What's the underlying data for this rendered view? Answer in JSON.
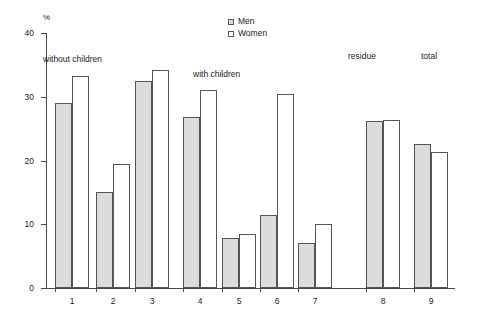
{
  "chart_data": {
    "type": "bar",
    "title": "",
    "xlabel": "",
    "ylabel": "%",
    "ylim": [
      0,
      40
    ],
    "yticks": [
      0,
      10,
      20,
      30,
      40
    ],
    "grid": false,
    "legend_position": "top-center",
    "categories": [
      "1",
      "2",
      "3",
      "4",
      "5",
      "6",
      "7",
      "8",
      "9"
    ],
    "series": [
      {
        "name": "Men",
        "color": "#dcdcdc",
        "values": [
          29.0,
          15.0,
          32.5,
          26.8,
          7.8,
          11.5,
          7.0,
          26.2,
          22.6
        ]
      },
      {
        "name": "Women",
        "color": "#ffffff",
        "values": [
          33.3,
          19.4,
          34.2,
          31.0,
          8.4,
          30.5,
          10.0,
          26.3,
          21.4
        ]
      }
    ],
    "annotations": [
      {
        "text": "without children",
        "at_category": "1",
        "spans": [
          "1",
          "2",
          "3"
        ]
      },
      {
        "text": "with children",
        "at_category": "4",
        "spans": [
          "4",
          "5",
          "6",
          "7"
        ]
      },
      {
        "text": "residue",
        "at_category": "8",
        "spans": [
          "8"
        ]
      },
      {
        "text": "total",
        "at_category": "9",
        "spans": [
          "9"
        ]
      }
    ]
  },
  "legend": {
    "items": [
      {
        "label": "Men"
      },
      {
        "label": "Women"
      }
    ]
  },
  "axis": {
    "y_unit": "%",
    "y_tick_labels": [
      "40",
      "30",
      "20",
      "10",
      "0"
    ],
    "x_tick_labels": [
      "1",
      "2",
      "3",
      "4",
      "5",
      "6",
      "7",
      "8",
      "9"
    ]
  },
  "annotations": {
    "without_children": "without children",
    "with_children": "with children",
    "residue": "residue",
    "total": "total"
  }
}
